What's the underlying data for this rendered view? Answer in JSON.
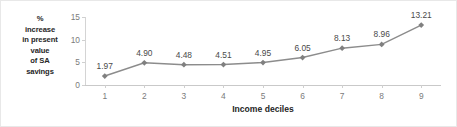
{
  "chart_data": {
    "type": "line",
    "title": "",
    "xlabel": "Income deciles",
    "ylabel": "% increase in present value of SA savings",
    "ylabel_lines": [
      "%",
      "increase",
      "in present",
      "value",
      "of SA",
      "savings"
    ],
    "categories": [
      "1",
      "2",
      "3",
      "4",
      "5",
      "6",
      "7",
      "8",
      "9"
    ],
    "values": [
      1.97,
      4.9,
      4.48,
      4.51,
      4.95,
      6.05,
      8.13,
      8.96,
      13.21
    ],
    "point_labels": [
      "1.97",
      "4.90",
      "4.48",
      "4.51",
      "4.95",
      "6.05",
      "8.13",
      "8.96",
      "13.21"
    ],
    "ylim": [
      0,
      15
    ],
    "yticks": [
      0,
      5,
      10,
      15
    ],
    "ytick_labels": [
      "0",
      "5",
      "10",
      "15"
    ],
    "xlim": [
      0.5,
      9.5
    ],
    "grid": false,
    "legend": "none",
    "marker": "diamond",
    "series_color": "#8c8c8c",
    "marker_color": "#808080",
    "axis_color": "#cfcfcf",
    "tick_text_color": "#7b7b7b",
    "label_text_color": "#4a4a4a",
    "axis_title_color": "#1f1f1f"
  }
}
